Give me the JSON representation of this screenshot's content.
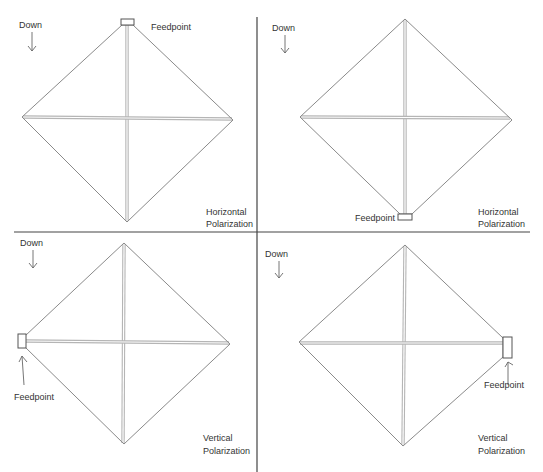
{
  "diagram": {
    "panels": [
      {
        "id": "top-left",
        "down_label": "Down",
        "feedpoint_label": "Feedpoint",
        "feedpoint_position": "top",
        "polarization_line1": "Horizontal",
        "polarization_line2": "Polarization"
      },
      {
        "id": "top-right",
        "down_label": "Down",
        "feedpoint_label": "Feedpoint",
        "feedpoint_position": "bottom",
        "polarization_line1": "Horizontal",
        "polarization_line2": "Polarization"
      },
      {
        "id": "bottom-left",
        "down_label": "Down",
        "feedpoint_label": "Feedpoint",
        "feedpoint_position": "left",
        "polarization_line1": "Vertical",
        "polarization_line2": "Polarization"
      },
      {
        "id": "bottom-right",
        "down_label": "Down",
        "feedpoint_label": "Feedpoint",
        "feedpoint_position": "right",
        "polarization_line1": "Vertical",
        "polarization_line2": "Polarization"
      }
    ],
    "colors": {
      "frame": "#8a8a8a",
      "spreader": "#b5b5b5",
      "divider": "#444444",
      "text": "#333333"
    }
  }
}
